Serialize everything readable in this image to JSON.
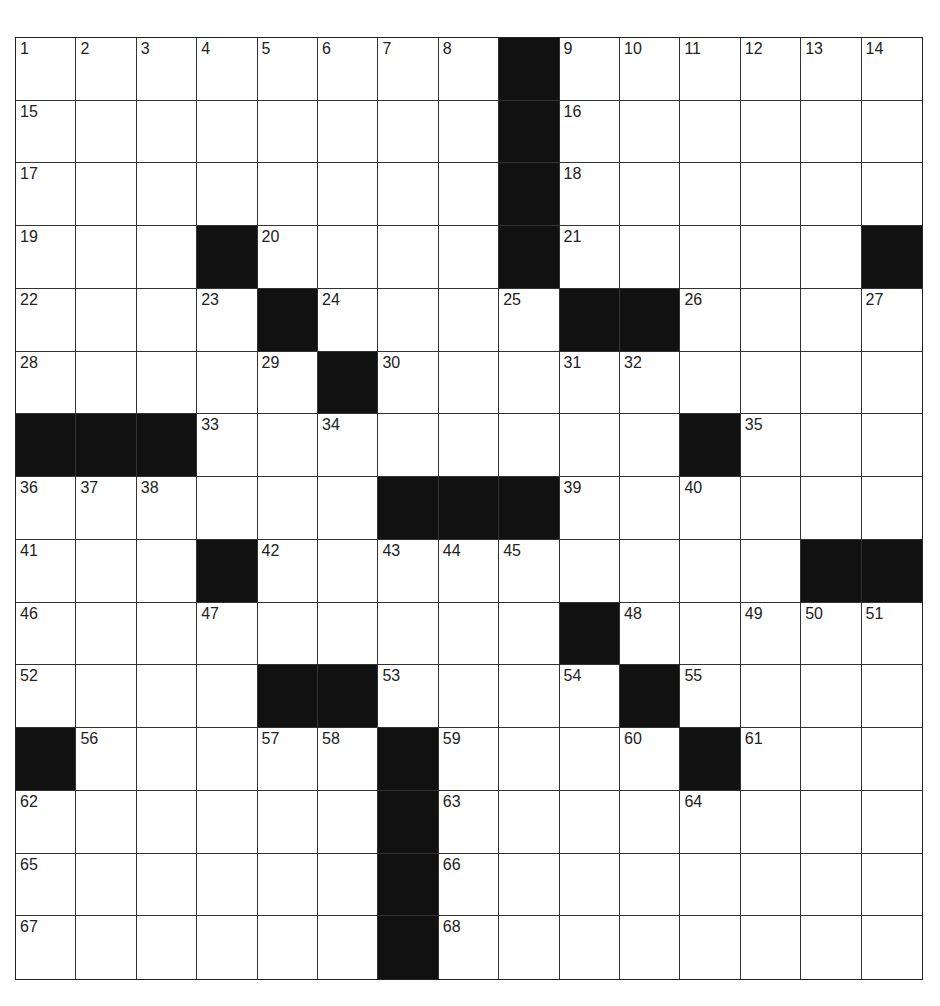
{
  "puzzle": {
    "rows": 15,
    "cols": 15,
    "colors": {
      "black": "#111111",
      "white": "#ffffff",
      "line": "#333333"
    },
    "layout": [
      "........#......",
      "........#......",
      "........#......",
      "...#....#.....#",
      "....#....##....",
      ".....#.........",
      "###........#...",
      "......###......",
      "...#.........###",
      ".........#.....",
      "....##....#....",
      "#.....#....#...",
      "......#........",
      "......#........",
      "......#........"
    ],
    "numbers": [
      {
        "r": 0,
        "c": 0,
        "n": "1"
      },
      {
        "r": 0,
        "c": 1,
        "n": "2"
      },
      {
        "r": 0,
        "c": 2,
        "n": "3"
      },
      {
        "r": 0,
        "c": 3,
        "n": "4"
      },
      {
        "r": 0,
        "c": 4,
        "n": "5"
      },
      {
        "r": 0,
        "c": 5,
        "n": "6"
      },
      {
        "r": 0,
        "c": 6,
        "n": "7"
      },
      {
        "r": 0,
        "c": 7,
        "n": "8"
      },
      {
        "r": 0,
        "c": 9,
        "n": "9"
      },
      {
        "r": 0,
        "c": 10,
        "n": "10"
      },
      {
        "r": 0,
        "c": 11,
        "n": "11"
      },
      {
        "r": 0,
        "c": 12,
        "n": "12"
      },
      {
        "r": 0,
        "c": 13,
        "n": "13"
      },
      {
        "r": 0,
        "c": 14,
        "n": "14"
      },
      {
        "r": 1,
        "c": 0,
        "n": "15"
      },
      {
        "r": 1,
        "c": 9,
        "n": "16"
      },
      {
        "r": 2,
        "c": 0,
        "n": "17"
      },
      {
        "r": 2,
        "c": 9,
        "n": "18"
      },
      {
        "r": 3,
        "c": 0,
        "n": "19"
      },
      {
        "r": 3,
        "c": 4,
        "n": "20"
      },
      {
        "r": 3,
        "c": 9,
        "n": "21"
      },
      {
        "r": 4,
        "c": 0,
        "n": "22"
      },
      {
        "r": 4,
        "c": 3,
        "n": "23"
      },
      {
        "r": 4,
        "c": 5,
        "n": "24"
      },
      {
        "r": 4,
        "c": 8,
        "n": "25"
      },
      {
        "r": 4,
        "c": 11,
        "n": "26"
      },
      {
        "r": 4,
        "c": 14,
        "n": "27"
      },
      {
        "r": 5,
        "c": 0,
        "n": "28"
      },
      {
        "r": 5,
        "c": 4,
        "n": "29"
      },
      {
        "r": 5,
        "c": 6,
        "n": "30"
      },
      {
        "r": 5,
        "c": 9,
        "n": "31"
      },
      {
        "r": 5,
        "c": 10,
        "n": "32"
      },
      {
        "r": 6,
        "c": 3,
        "n": "33"
      },
      {
        "r": 6,
        "c": 5,
        "n": "34"
      },
      {
        "r": 6,
        "c": 12,
        "n": "35"
      },
      {
        "r": 7,
        "c": 0,
        "n": "36"
      },
      {
        "r": 7,
        "c": 1,
        "n": "37"
      },
      {
        "r": 7,
        "c": 2,
        "n": "38"
      },
      {
        "r": 7,
        "c": 9,
        "n": "39"
      },
      {
        "r": 7,
        "c": 11,
        "n": "40"
      },
      {
        "r": 8,
        "c": 0,
        "n": "41"
      },
      {
        "r": 8,
        "c": 4,
        "n": "42"
      },
      {
        "r": 8,
        "c": 6,
        "n": "43"
      },
      {
        "r": 8,
        "c": 7,
        "n": "44"
      },
      {
        "r": 8,
        "c": 8,
        "n": "45"
      },
      {
        "r": 9,
        "c": 0,
        "n": "46"
      },
      {
        "r": 9,
        "c": 3,
        "n": "47"
      },
      {
        "r": 9,
        "c": 10,
        "n": "48"
      },
      {
        "r": 9,
        "c": 12,
        "n": "49"
      },
      {
        "r": 9,
        "c": 13,
        "n": "50"
      },
      {
        "r": 9,
        "c": 14,
        "n": "51"
      },
      {
        "r": 10,
        "c": 0,
        "n": "52"
      },
      {
        "r": 10,
        "c": 6,
        "n": "53"
      },
      {
        "r": 10,
        "c": 9,
        "n": "54"
      },
      {
        "r": 10,
        "c": 11,
        "n": "55"
      },
      {
        "r": 11,
        "c": 1,
        "n": "56"
      },
      {
        "r": 11,
        "c": 4,
        "n": "57"
      },
      {
        "r": 11,
        "c": 5,
        "n": "58"
      },
      {
        "r": 11,
        "c": 7,
        "n": "59"
      },
      {
        "r": 11,
        "c": 10,
        "n": "60"
      },
      {
        "r": 11,
        "c": 12,
        "n": "61"
      },
      {
        "r": 12,
        "c": 0,
        "n": "62"
      },
      {
        "r": 12,
        "c": 7,
        "n": "63"
      },
      {
        "r": 12,
        "c": 11,
        "n": "64"
      },
      {
        "r": 13,
        "c": 0,
        "n": "65"
      },
      {
        "r": 13,
        "c": 7,
        "n": "66"
      },
      {
        "r": 14,
        "c": 0,
        "n": "67"
      },
      {
        "r": 14,
        "c": 7,
        "n": "68"
      }
    ],
    "entries": []
  }
}
